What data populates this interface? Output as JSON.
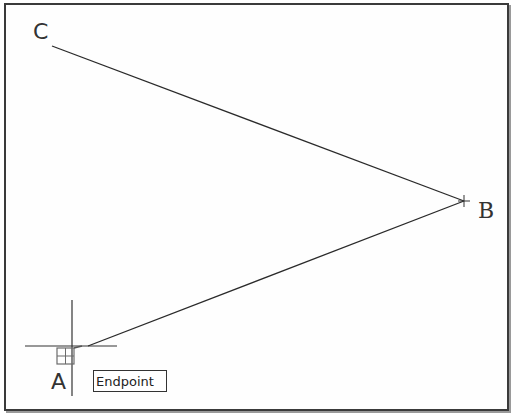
{
  "drawing": {
    "points": [
      {
        "label": "C",
        "x": 52,
        "y": 46
      },
      {
        "label": "B",
        "x": 464,
        "y": 201
      },
      {
        "label": "A",
        "x": 88,
        "y": 346
      }
    ],
    "lines": [
      {
        "from": "C",
        "to": "B"
      },
      {
        "from": "B",
        "to": "A"
      }
    ]
  },
  "labels": {
    "c": "C",
    "b": "B",
    "a": "A"
  },
  "snap": {
    "tooltip": "Endpoint",
    "crosshair": {
      "x": 72,
      "y": 346
    }
  },
  "colors": {
    "line": "#2a2a2a",
    "frame": "#3a3a3a",
    "marker": "#6b6b6b"
  }
}
